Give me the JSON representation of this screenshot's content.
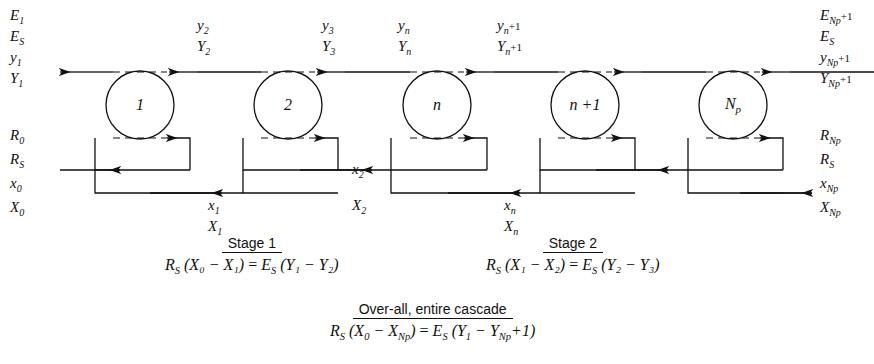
{
  "diagram": {
    "stroke_color": "#111111",
    "background": "#ffffff",
    "stages": [
      {
        "id": "stage-1",
        "label": "1",
        "cx": 140,
        "cy": 105
      },
      {
        "id": "stage-2",
        "label": "2",
        "cx": 288,
        "cy": 105
      },
      {
        "id": "stage-n",
        "label": "n",
        "cx": 437,
        "cy": 105
      },
      {
        "id": "stage-n-plus-1",
        "label": "n +1",
        "cx": 585,
        "cy": 105
      },
      {
        "id": "stage-np",
        "label": "N",
        "sub": "p",
        "cx": 733,
        "cy": 105
      }
    ],
    "left_top_labels": [
      {
        "main": "E",
        "sub": "1"
      },
      {
        "main": "E",
        "sub": "S"
      },
      {
        "main": "y",
        "sub": "1"
      },
      {
        "main": "Y",
        "sub": "1"
      }
    ],
    "left_bottom_labels": [
      {
        "main": "R",
        "sub": "0"
      },
      {
        "main": "R",
        "sub": "S"
      },
      {
        "main": "x",
        "sub": "0"
      },
      {
        "main": "X",
        "sub": "0"
      }
    ],
    "right_top_labels": [
      {
        "main": "E",
        "sub": "N",
        "sub2": "p",
        "tail": "+1"
      },
      {
        "main": "E",
        "sub": "S"
      },
      {
        "main": "y",
        "sub": "N",
        "sub2": "p",
        "tail": "+1"
      },
      {
        "main": "Y",
        "sub": "N",
        "sub2": "p",
        "tail": "+1"
      }
    ],
    "right_bottom_labels": [
      {
        "main": "R",
        "sub": "N",
        "sub2": "p"
      },
      {
        "main": "R",
        "sub": "S"
      },
      {
        "main": "x",
        "sub": "N",
        "sub2": "p"
      },
      {
        "main": "X",
        "sub": "N",
        "sub2": "p"
      }
    ],
    "vapor_labels": [
      {
        "id": "y2",
        "lower": "y",
        "lower_sub": "2",
        "upper": "Y",
        "upper_sub": "2",
        "x": 197,
        "y": 18
      },
      {
        "id": "y3",
        "lower": "y",
        "lower_sub": "3",
        "upper": "Y",
        "upper_sub": "3",
        "x": 322,
        "y": 18
      },
      {
        "id": "yn",
        "lower": "y",
        "lower_sub": "n",
        "upper": "Y",
        "upper_sub": "n",
        "x": 398,
        "y": 18
      },
      {
        "id": "yn1",
        "lower": "y",
        "lower_sub": "n",
        "lower_tail": "+1",
        "upper": "Y",
        "upper_sub": "n",
        "upper_tail": "+1",
        "x": 497,
        "y": 18
      }
    ],
    "liquid_labels": [
      {
        "id": "x1",
        "lower": "x",
        "lower_sub": "1",
        "upper": "X",
        "upper_sub": "1",
        "x": 208,
        "y": 190
      },
      {
        "id": "x2",
        "lower": "x",
        "lower_sub": "2",
        "upper": "X",
        "upper_sub": "2",
        "x": 352,
        "y": 166
      },
      {
        "id": "xn",
        "lower": "x",
        "lower_sub": "n",
        "upper": "X",
        "upper_sub": "n",
        "x": 504,
        "y": 190
      }
    ],
    "equations": [
      {
        "id": "stage-1-equation",
        "heading": "Stage 1",
        "lhs_coef": "R",
        "lhs_coef_sub": "S",
        "lhs": "(X₀ − X₁)",
        "eq": "=",
        "rhs_coef": "E",
        "rhs_coef_sub": "S",
        "rhs": "(Y₁ − Y₂)",
        "x": 165,
        "y": 228
      },
      {
        "id": "stage-2-equation",
        "heading": "Stage 2",
        "lhs_coef": "R",
        "lhs_coef_sub": "S",
        "lhs": "(X₁ − X₂)",
        "eq": "=",
        "rhs_coef": "E",
        "rhs_coef_sub": "S",
        "rhs": "(Y₂ − Y₃)",
        "x": 486,
        "y": 228
      }
    ],
    "overall_equation": {
      "id": "overall-equation",
      "heading": "Over-all, entire cascade",
      "lhs_coef": "R",
      "lhs_coef_sub": "S",
      "lhs_open": "(X",
      "lhs_x0_sub": "0",
      "lhs_minus": "−",
      "lhs_x": "X",
      "lhs_x_sub": "N",
      "lhs_x_sub2": "p",
      "lhs_close": ")",
      "eq": "=",
      "rhs_coef": "E",
      "rhs_coef_sub": "S",
      "rhs_open": "(Y",
      "rhs_y1_sub": "1",
      "rhs_minus": "−",
      "rhs_y": "Y",
      "rhs_y_sub": "N",
      "rhs_y_sub2": "p",
      "rhs_tail": "+1",
      "rhs_close": ")",
      "x": 330,
      "y": 295
    }
  }
}
